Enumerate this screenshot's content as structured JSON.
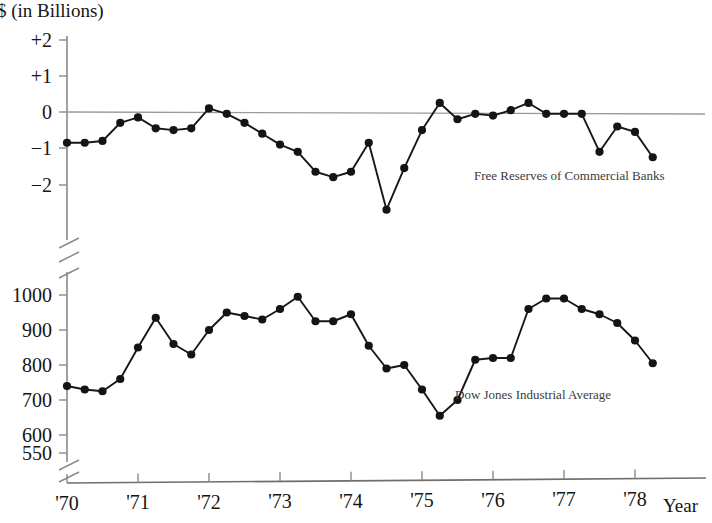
{
  "figure": {
    "unit_title": "$ (in Billions)",
    "x_axis_name": "Year"
  },
  "chart_data": {
    "type": "line",
    "title": "$ (in Billions)",
    "xlabel": "Year",
    "ylabel": "",
    "grid": false,
    "legend_position": "inline-annotation",
    "panels": [
      {
        "panel_id": "free-reserves",
        "series_name": "Free Reserves of Commercial Banks",
        "annotation": "Free Reserves of Commercial Banks",
        "ylabel": "$ (in Billions)",
        "ylim": [
          -2.9,
          2.0
        ],
        "yticks": [
          2,
          1,
          0,
          -1,
          -2
        ],
        "ytick_labels": [
          "+2",
          "+1",
          "0",
          "−1",
          "−2"
        ],
        "axis_break_bottom": true,
        "zero_reference_line": true,
        "x": [
          1970.0,
          1970.25,
          1970.5,
          1970.75,
          1971.0,
          1971.25,
          1971.5,
          1971.75,
          1972.0,
          1972.25,
          1972.5,
          1972.75,
          1973.0,
          1973.25,
          1973.5,
          1973.75,
          1974.0,
          1974.25,
          1974.5,
          1974.75,
          1975.0,
          1975.25,
          1975.5,
          1975.75,
          1976.0,
          1976.25,
          1976.5,
          1976.75,
          1977.0,
          1977.25,
          1977.5,
          1977.75,
          1978.0,
          1978.25
        ],
        "values": [
          -0.85,
          -0.85,
          -0.8,
          -0.3,
          -0.15,
          -0.45,
          -0.5,
          -0.45,
          0.1,
          -0.05,
          -0.3,
          -0.6,
          -0.9,
          -1.1,
          -1.65,
          -1.8,
          -1.65,
          -0.85,
          -2.7,
          -1.55,
          -0.5,
          0.25,
          -0.2,
          -0.05,
          -0.1,
          0.05,
          0.25,
          -0.05,
          -0.05,
          -0.05,
          -1.1,
          -0.4,
          -0.55,
          -1.25
        ]
      },
      {
        "panel_id": "dow-jones",
        "series_name": "Dow Jones Industrial Average",
        "annotation": "Dow Jones Industrial Average",
        "ylabel": "",
        "ylim": [
          540,
          1030
        ],
        "yticks": [
          1000,
          900,
          800,
          700,
          600,
          550
        ],
        "ytick_labels": [
          "1000",
          "900",
          "800",
          "700",
          "600",
          "550"
        ],
        "axis_break_bottom": true,
        "zero_reference_line": false,
        "x": [
          1970.0,
          1970.25,
          1970.5,
          1970.75,
          1971.0,
          1971.25,
          1971.5,
          1971.75,
          1972.0,
          1972.25,
          1972.5,
          1972.75,
          1973.0,
          1973.25,
          1973.5,
          1973.75,
          1974.0,
          1974.25,
          1974.5,
          1974.75,
          1975.0,
          1975.25,
          1975.5,
          1975.75,
          1976.0,
          1976.25,
          1976.5,
          1976.75,
          1977.0,
          1977.25,
          1977.5,
          1977.75,
          1978.0,
          1978.25
        ],
        "values": [
          740,
          730,
          725,
          760,
          850,
          935,
          860,
          830,
          900,
          950,
          940,
          930,
          960,
          995,
          925,
          925,
          945,
          855,
          790,
          800,
          730,
          655,
          700,
          815,
          820,
          820,
          960,
          990,
          990,
          960,
          945,
          920,
          870,
          805
        ]
      }
    ],
    "xticks": [
      1970,
      1971,
      1972,
      1973,
      1974,
      1975,
      1976,
      1977,
      1978
    ],
    "xtick_labels": [
      "'70",
      "'71",
      "'72",
      "'73",
      "'74",
      "'75",
      "'76",
      "'77",
      "'78"
    ],
    "xlim": [
      1970,
      1978.6
    ]
  }
}
